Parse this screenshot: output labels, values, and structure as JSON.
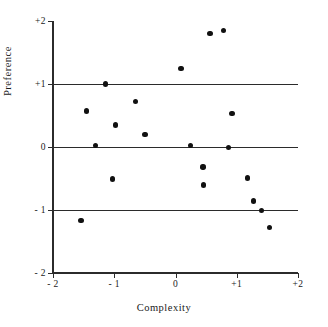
{
  "chart_data": {
    "type": "scatter",
    "title": "",
    "xlabel": "Complexity",
    "ylabel": "Preference",
    "xlim": [
      -2,
      2
    ],
    "ylim": [
      -2,
      2
    ],
    "grid": true,
    "gridlines_y": [
      1,
      0,
      -1
    ],
    "legend": null,
    "xticks": [
      -2,
      -1,
      0,
      1,
      2
    ],
    "xticklabels": [
      "- 2",
      "- 1",
      "0",
      "+1",
      "+2"
    ],
    "yticks": [
      2,
      1,
      0,
      -1,
      -2
    ],
    "yticklabels": [
      "+2",
      "+1",
      "0",
      "- 1",
      "- 2"
    ],
    "marker": "filled-circle",
    "marker_color": "#111111",
    "points": [
      {
        "x": -1.54,
        "y": -1.17
      },
      {
        "x": -1.45,
        "y": 0.57
      },
      {
        "x": -1.31,
        "y": 0.02
      },
      {
        "x": -1.14,
        "y": 1.0
      },
      {
        "x": -1.03,
        "y": -0.51
      },
      {
        "x": -0.98,
        "y": 0.35
      },
      {
        "x": -0.65,
        "y": 0.72
      },
      {
        "x": -0.5,
        "y": 0.2
      },
      {
        "x": 0.09,
        "y": 1.25
      },
      {
        "x": 0.24,
        "y": 0.02
      },
      {
        "x": 0.45,
        "y": -0.32
      },
      {
        "x": 0.46,
        "y": -0.6
      },
      {
        "x": 0.56,
        "y": 1.8
      },
      {
        "x": 0.78,
        "y": 1.85
      },
      {
        "x": 0.87,
        "y": -0.01
      },
      {
        "x": 0.92,
        "y": 0.53
      },
      {
        "x": 1.18,
        "y": -0.49
      },
      {
        "x": 1.27,
        "y": -0.86
      },
      {
        "x": 1.4,
        "y": -1.01
      },
      {
        "x": 1.53,
        "y": -1.28
      }
    ]
  }
}
